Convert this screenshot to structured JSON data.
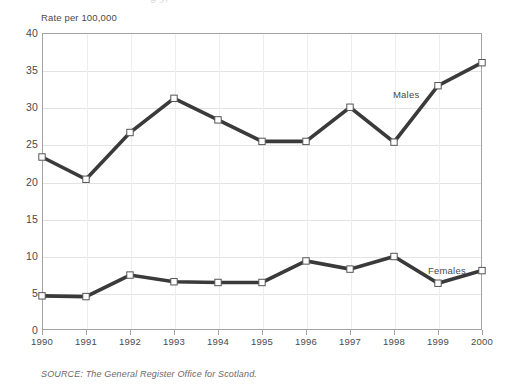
{
  "figure": {
    "clipped_title_fragment": "g y,",
    "y_axis_caption": "Rate per 100,000",
    "source_note": "SOURCE: The General Register Office for Scotland."
  },
  "chart_data": {
    "type": "line",
    "title": "",
    "xlabel": "",
    "ylabel": "Rate per 100,000",
    "categories": [
      "1990",
      "1991",
      "1992",
      "1993",
      "1994",
      "1995",
      "1996",
      "1997",
      "1998",
      "1999",
      "2000"
    ],
    "x": [
      1990,
      1991,
      1992,
      1993,
      1994,
      1995,
      1996,
      1997,
      1998,
      1999,
      2000
    ],
    "ylim": [
      0,
      40
    ],
    "yticks": [
      0,
      5,
      10,
      15,
      20,
      25,
      30,
      35,
      40
    ],
    "grid": "horizontal-and-vertical",
    "legend_position": "inline-end-of-series",
    "marker": "open-square",
    "series": [
      {
        "name": "Males",
        "color": "#3a3a3a",
        "values": [
          23.3,
          20.3,
          26.6,
          31.2,
          28.3,
          25.4,
          25.4,
          30.0,
          25.3,
          32.9,
          36.0
        ]
      },
      {
        "name": "Females",
        "color": "#3a3a3a",
        "values": [
          4.6,
          4.5,
          7.4,
          6.5,
          6.4,
          6.4,
          9.3,
          8.2,
          9.9,
          6.3,
          8.0
        ]
      }
    ]
  }
}
